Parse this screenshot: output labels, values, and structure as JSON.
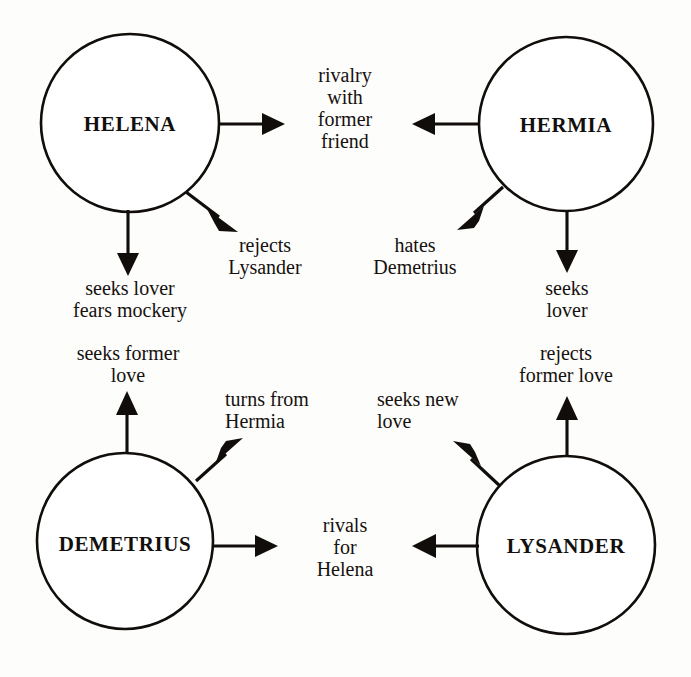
{
  "diagram": {
    "background_color": "#fdfdfb",
    "stroke_color": "#100d0b",
    "nodes": [
      {
        "id": "helena",
        "label": "HELENA",
        "cx": 130,
        "cy": 123,
        "r": 89
      },
      {
        "id": "hermia",
        "label": "HERMIA",
        "cx": 566,
        "cy": 124,
        "r": 87
      },
      {
        "id": "demetrius",
        "label": "DEMETRIUS",
        "cx": 125,
        "cy": 541,
        "r": 88
      },
      {
        "id": "lysander",
        "label": "LYSANDER",
        "cx": 566,
        "cy": 545,
        "r": 89
      }
    ],
    "labels": [
      {
        "id": "rivalry-with-former-friend",
        "text": "rivalry\nwith\nformer\nfriend",
        "from": "helena-and-hermia",
        "x": 345,
        "y": 64,
        "align": "center"
      },
      {
        "id": "rejects-lysander",
        "text": "rejects\nLysander",
        "from": "helena",
        "x": 265,
        "y": 234,
        "align": "center"
      },
      {
        "id": "seeks-lover-fears-mockery",
        "text": "seeks lover\nfears mockery",
        "from": "helena",
        "x": 130,
        "y": 277,
        "align": "center"
      },
      {
        "id": "hates-demetrius",
        "text": "hates\nDemetrius",
        "from": "hermia",
        "x": 415,
        "y": 234,
        "align": "center"
      },
      {
        "id": "seeks-lover",
        "text": "seeks\nlover",
        "from": "hermia",
        "x": 567,
        "y": 277,
        "align": "center"
      },
      {
        "id": "seeks-former-love",
        "text": "seeks former\nlove",
        "from": "demetrius",
        "x": 128,
        "y": 342,
        "align": "center"
      },
      {
        "id": "turns-from-hermia",
        "text": "turns from\nHermia",
        "from": "demetrius",
        "x": 225,
        "y": 388,
        "align": "left"
      },
      {
        "id": "seeks-new-love",
        "text": "seeks new\nlove",
        "from": "lysander",
        "x": 377,
        "y": 388,
        "align": "left"
      },
      {
        "id": "rejects-former-love",
        "text": "rejects\nformer love",
        "from": "lysander",
        "x": 566,
        "y": 342,
        "align": "center"
      },
      {
        "id": "rivals-for-helena",
        "text": "rivals\nfor\nHelena",
        "from": "demetrius-and-lysander",
        "x": 345,
        "y": 514,
        "align": "center"
      }
    ],
    "edges": [
      {
        "id": "helena-rivalry",
        "source": "HELENA",
        "relation": "rivalry with former friend",
        "direction": "right"
      },
      {
        "id": "helena-rejects",
        "source": "HELENA",
        "relation": "rejects Lysander",
        "direction": "down-right"
      },
      {
        "id": "helena-seeks",
        "source": "HELENA",
        "relation": "seeks lover fears mockery",
        "direction": "down"
      },
      {
        "id": "hermia-rivalry",
        "source": "HERMIA",
        "relation": "rivalry with former friend",
        "direction": "left"
      },
      {
        "id": "hermia-hates",
        "source": "HERMIA",
        "relation": "hates Demetrius",
        "direction": "down-left"
      },
      {
        "id": "hermia-seeks",
        "source": "HERMIA",
        "relation": "seeks lover",
        "direction": "down"
      },
      {
        "id": "demetrius-seeks",
        "source": "DEMETRIUS",
        "relation": "seeks former love",
        "direction": "up"
      },
      {
        "id": "demetrius-turns",
        "source": "DEMETRIUS",
        "relation": "turns from Hermia",
        "direction": "up-right"
      },
      {
        "id": "demetrius-rivals",
        "source": "DEMETRIUS",
        "relation": "rivals for Helena",
        "direction": "right"
      },
      {
        "id": "lysander-rejects",
        "source": "LYSANDER",
        "relation": "rejects former love",
        "direction": "up"
      },
      {
        "id": "lysander-seeks",
        "source": "LYSANDER",
        "relation": "seeks new love",
        "direction": "up-left"
      },
      {
        "id": "lysander-rivals",
        "source": "LYSANDER",
        "relation": "rivals for Helena",
        "direction": "left"
      }
    ]
  }
}
